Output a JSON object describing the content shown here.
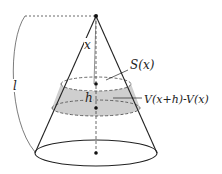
{
  "diagram": {
    "type": "cone-volume-slice",
    "labels": {
      "slant_length": "l",
      "distance_from_apex": "x",
      "slice_thickness": "h",
      "cross_section_area": "S(x)",
      "slice_volume": "V(x+h)-V(x)"
    },
    "colors": {
      "stroke": "#222222",
      "shaded_band": "#cfcfcf",
      "background": "#ffffff"
    }
  }
}
